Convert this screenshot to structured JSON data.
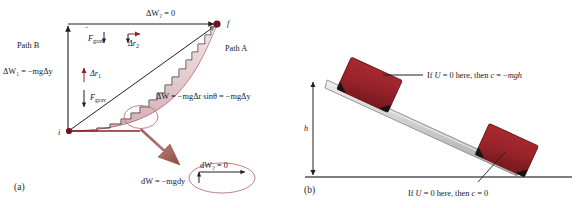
{
  "figure": {
    "background": "#ffffff"
  },
  "colors": {
    "dark_red": "#8f1f28",
    "block_red": "#a32327",
    "block_red_dark": "#7d1a1e",
    "ramp_gray": "#cfcfcf",
    "ramp_gray_dark": "#9a9a9a",
    "line_black": "#221f1f",
    "arrow_brown": "#9d5b52",
    "pink_curve": "#b5707a",
    "ground_gray": "#555555"
  },
  "panel_a": {
    "caption": "(a)",
    "points": {
      "initial": "i",
      "final": "f"
    },
    "paths": {
      "path_b": "Path B",
      "path_a": "Path A"
    },
    "labels": {
      "top_work": "ΔW₂ = 0",
      "left_work": "ΔW₁ = −mgΔy",
      "diagonal_work": "ΔW = −mgΔr sinθ = −mgΔy",
      "inset_work_horizontal": "dW₂ = 0",
      "inset_work_vertical": "dW = −mgdy"
    },
    "vectors": {
      "grav_top": "F⃗grav",
      "disp_top": "Δr⃗₂",
      "disp_left": "Δr⃗₁",
      "grav_left": "F⃗grav"
    },
    "vector_parts": {
      "F_symbol": "F",
      "grav_subscript": "grav",
      "delta_r_symbol": "Δr",
      "sub_1": "1",
      "sub_2": "2"
    }
  },
  "panel_b": {
    "caption": "(b)",
    "height_label": "h",
    "annotation_top": "If U = 0 here, then c = −mgh",
    "annotation_bottom": "If U = 0 here, then c = 0",
    "objects": {
      "incline": "inclined-plane",
      "block_top": "block-on-incline-top",
      "block_bottom": "block-on-incline-bottom",
      "ground": "ground-line"
    },
    "annotation_top_parts": {
      "if": "If ",
      "u": "U",
      "eq0": " = 0 here, then ",
      "c": "c",
      "eq": " = −",
      "mgh": "mgh"
    },
    "annotation_bottom_parts": {
      "if": "If ",
      "u": "U",
      "eq0": " = 0 here, then ",
      "c": "c",
      "eq": " = 0"
    }
  }
}
